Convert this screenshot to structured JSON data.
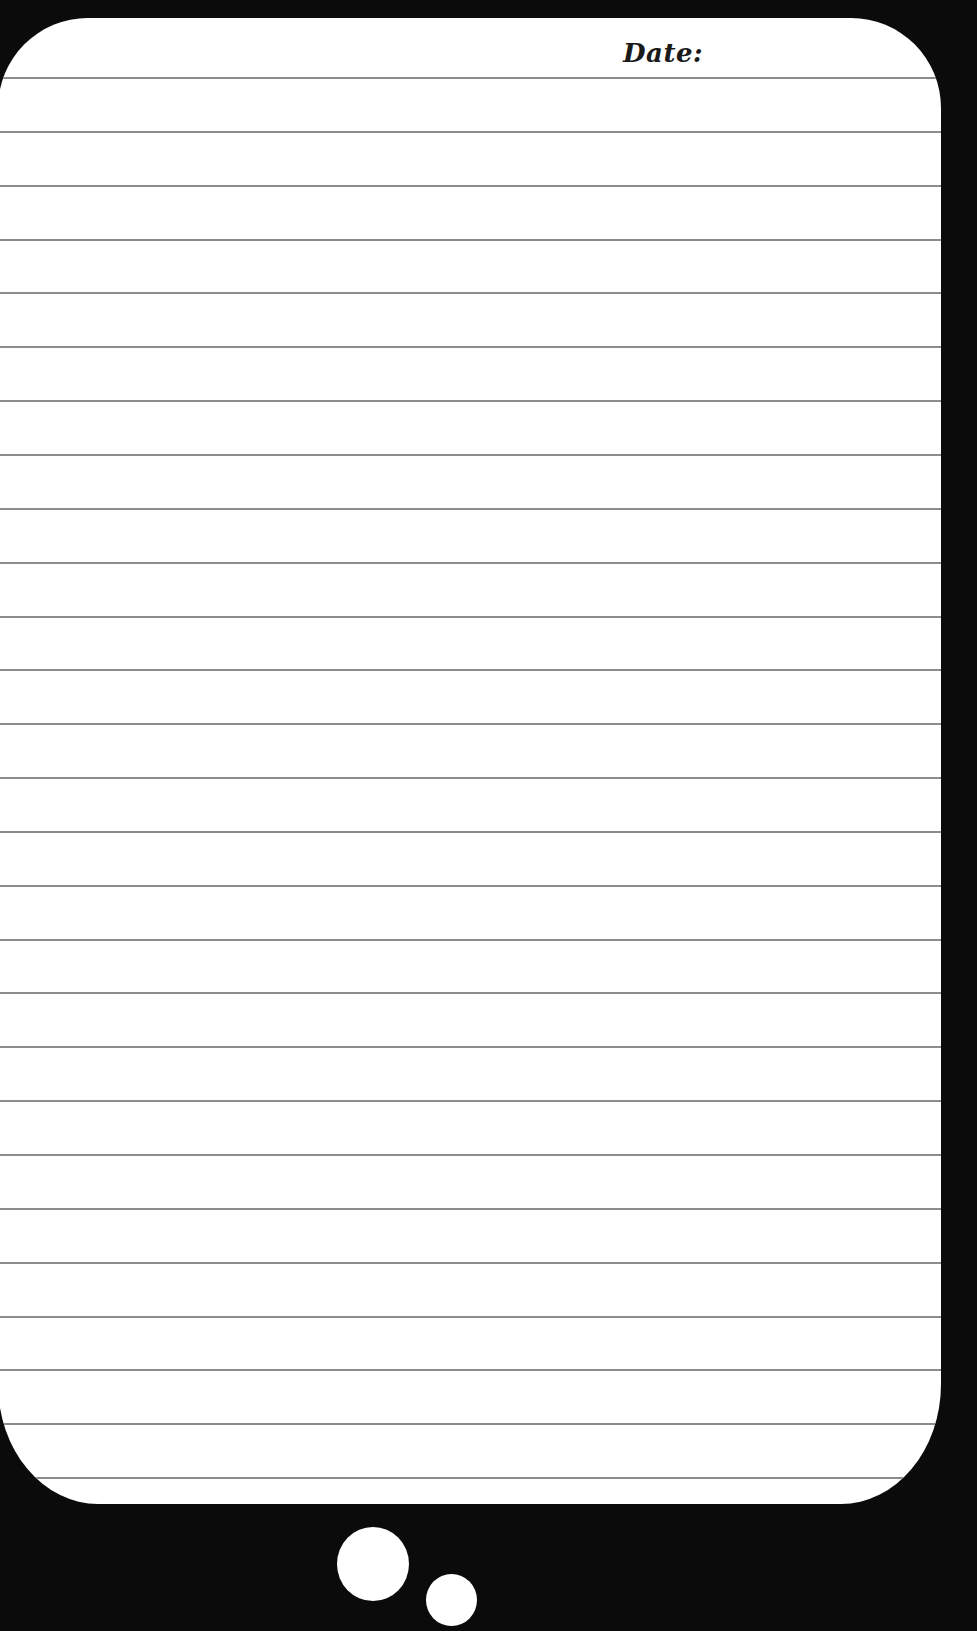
{
  "page": {
    "background_color": "#0b0b0b",
    "card_color": "#ffffff",
    "rule_color": "#8c8c8c"
  },
  "header": {
    "date_label": "Date:"
  },
  "ruled_lines": {
    "count": 27,
    "first_y": 59,
    "spacing": 53.85
  },
  "decorations": {
    "bubbles": [
      {
        "name": "large",
        "color": "#ffffff"
      },
      {
        "name": "small",
        "color": "#ffffff"
      }
    ]
  }
}
